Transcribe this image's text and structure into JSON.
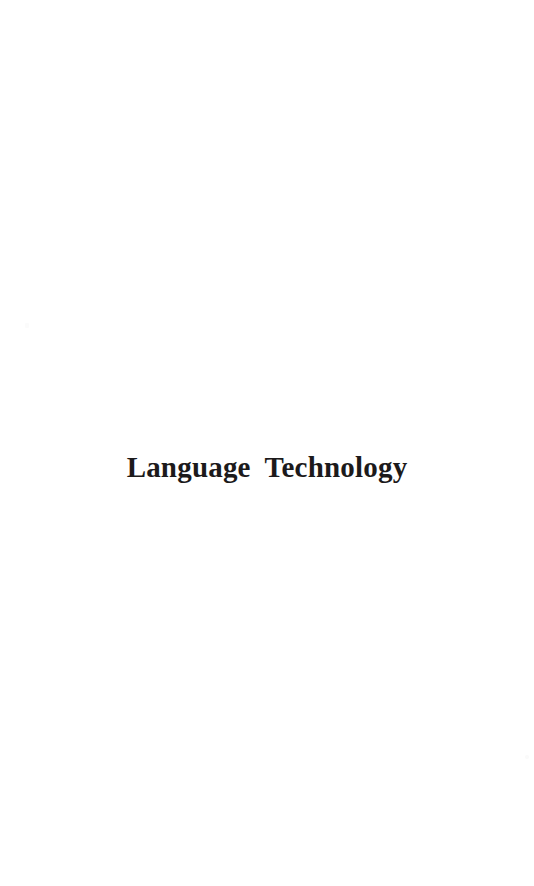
{
  "document": {
    "page_kind": "part-title-page",
    "background_color": "#ffffff",
    "text_color": "#1c1a1b",
    "title": "Language Technology",
    "body_text": "",
    "page_number": "",
    "header": "",
    "footer": ""
  },
  "artifacts": {
    "speck_one_label": "scan-speck",
    "speck_two_label": "scan-speck"
  }
}
